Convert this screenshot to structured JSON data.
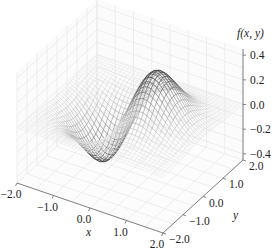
{
  "chart_data": {
    "type": "surface-wireframe-3d",
    "function": "f(x, y) = x * exp(-x^2 - y^2)",
    "title": "",
    "xlabel": "x",
    "ylabel": "y",
    "zlabel": "f(x, y)",
    "xlim": [
      -2.0,
      2.0
    ],
    "ylim": [
      -2.0,
      2.0
    ],
    "zlim": [
      -0.45,
      0.45
    ],
    "x_ticks": [
      "-2.0",
      "-1.0",
      "0.0",
      "1.0",
      "2.0"
    ],
    "y_ticks": [
      "-2.0",
      "-1.0",
      "0.0",
      "1.0",
      "2.0"
    ],
    "z_ticks": [
      "-0.4",
      "-0.2",
      "0.0",
      "0.2",
      "0.4"
    ],
    "x_tick_values": [
      -2,
      -1,
      0,
      1,
      2
    ],
    "y_tick_values": [
      -2,
      -1,
      0,
      1,
      2
    ],
    "z_tick_values": [
      -0.4,
      -0.2,
      0.0,
      0.2,
      0.4
    ],
    "grid": true,
    "grid_samples": 41,
    "peak": {
      "x": 0.707,
      "y": 0.0,
      "z": 0.429
    },
    "trough": {
      "x": -0.707,
      "y": 0.0,
      "z": -0.429
    },
    "colormap": "greys (darker at larger |z|)",
    "legend": null
  },
  "axes": {
    "x_label": "x",
    "y_label": "y",
    "z_label": "f(x, y)"
  }
}
